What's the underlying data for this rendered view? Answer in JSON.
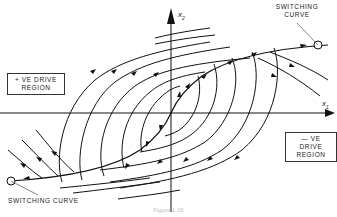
{
  "figure": {
    "axes": {
      "x_label": "x",
      "x_sub": "1",
      "y_label": "x",
      "y_sub": "2"
    },
    "labels": {
      "switching_curve_top": "SWITCHING\nCURVE",
      "switching_curve_top_l1": "SWITCHING",
      "switching_curve_top_l2": "CURVE",
      "switching_curve_bottom": "SWITCHING CURVE",
      "positive_region_l1": "+ VE DRIVE",
      "positive_region_l2": "REGION",
      "negative_region_l1": "— VE DRIVE",
      "negative_region_l2": "REGION"
    },
    "caption": "Figure 1.16"
  }
}
